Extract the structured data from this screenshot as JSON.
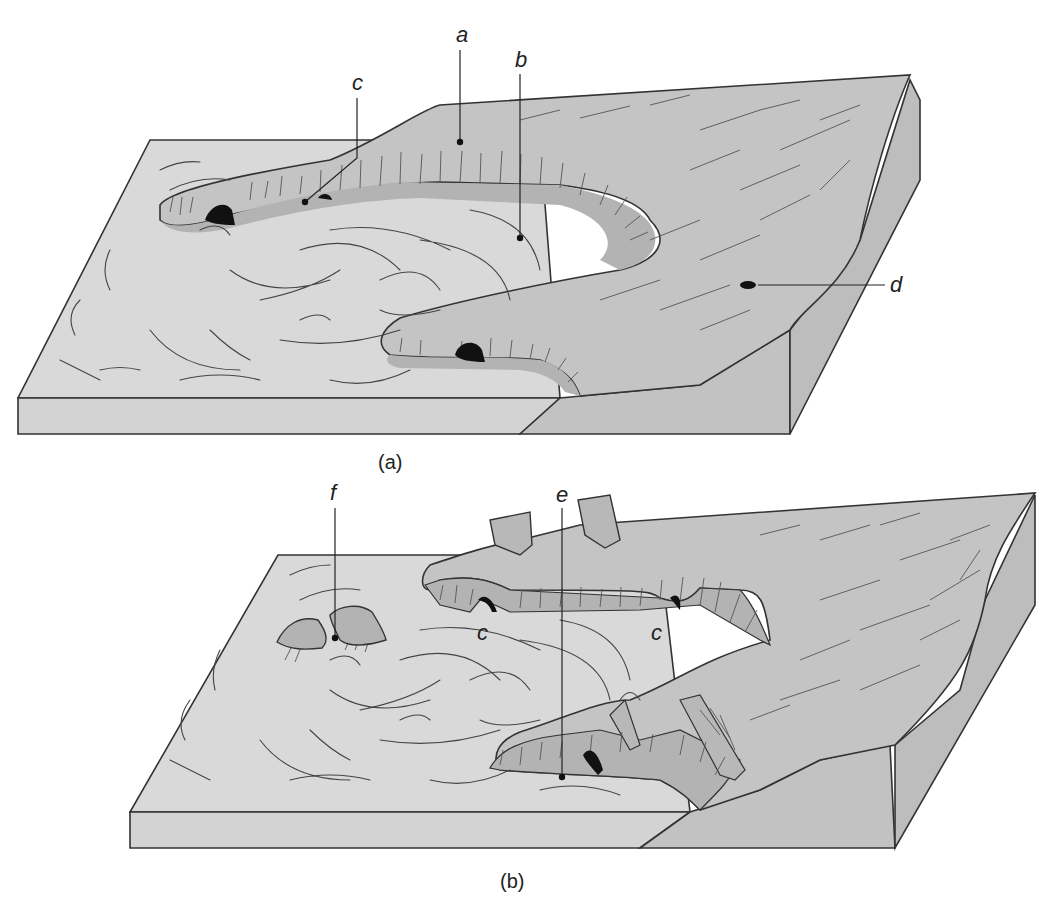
{
  "figure": {
    "colors": {
      "sea": "#d9d9d9",
      "land": "#c4c4c4",
      "land_side": "#bdbdbd",
      "cliff": "#b3b3b3",
      "cave": "#111111",
      "line": "#333333",
      "background": "#ffffff"
    },
    "panels": [
      {
        "id": "a",
        "caption": "(a)",
        "labels": [
          {
            "letter": "a",
            "meaning": "headland"
          },
          {
            "letter": "b",
            "meaning": "bay"
          },
          {
            "letter": "c",
            "meaning": "cave"
          },
          {
            "letter": "d",
            "meaning": "blowhole"
          }
        ]
      },
      {
        "id": "b",
        "caption": "(b)",
        "labels": [
          {
            "letter": "f",
            "meaning": "stacks"
          },
          {
            "letter": "e",
            "meaning": "arch"
          },
          {
            "letter": "c",
            "meaning": "cave"
          },
          {
            "letter": "c",
            "meaning": "cave"
          }
        ]
      }
    ]
  }
}
